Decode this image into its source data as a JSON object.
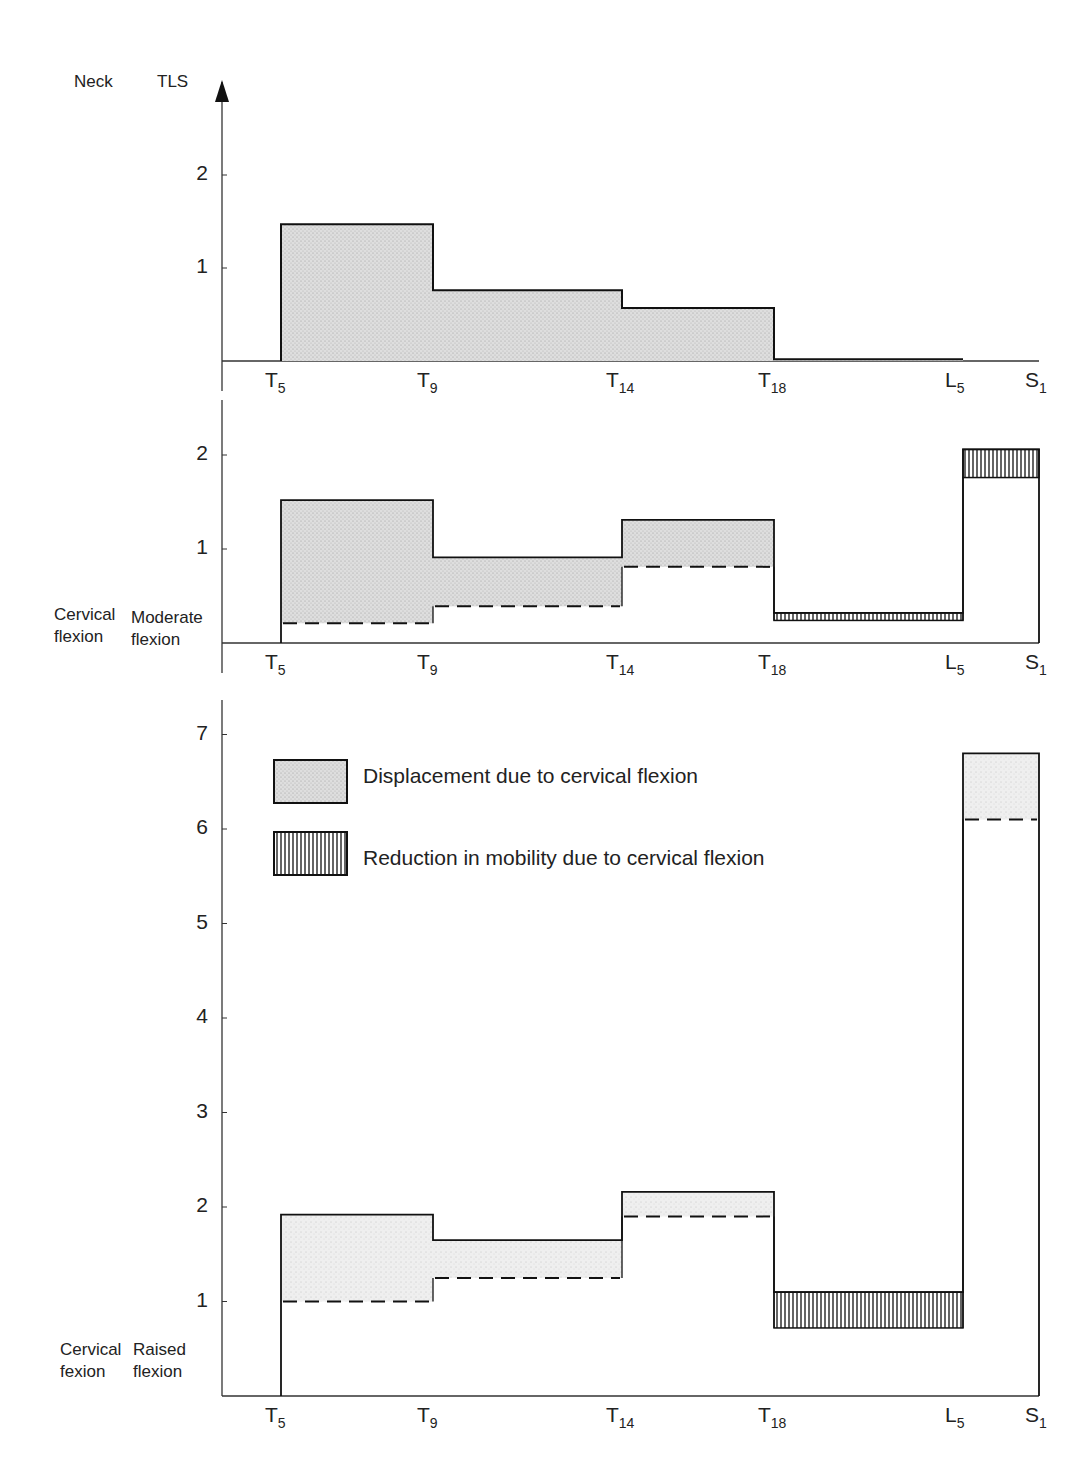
{
  "header": {
    "neck_label": "Neck",
    "tls_label": "TLS"
  },
  "panels": [
    {
      "id": "top",
      "left_label": [
        "",
        ""
      ],
      "right_label": [
        "",
        ""
      ]
    },
    {
      "id": "middle",
      "left_label": [
        "Cervical",
        "flexion"
      ],
      "right_label": [
        "Moderate",
        "flexion"
      ]
    },
    {
      "id": "bottom",
      "left_label": [
        "Cervical",
        "fexion"
      ],
      "right_label": [
        "Raised",
        "flexion"
      ]
    }
  ],
  "legend": {
    "displacement_label": "Displacement due to cervical flexion",
    "reduction_label": "Reduction in mobility due to cervical flexion"
  },
  "colors": {
    "stipple_fill": "#d9d9d9",
    "line": "#1a1a1a",
    "hatch": "#222222",
    "background": "#ffffff"
  },
  "chart_data": [
    {
      "type": "bar",
      "title": "Neck / TLS — baseline (neck neutral)",
      "categories": [
        "T5-T9",
        "T9-T14",
        "T14-T18",
        "T18-L5",
        "L5-S1"
      ],
      "x_ticks": [
        "T5",
        "T9",
        "T14",
        "T18",
        "L5",
        "S1"
      ],
      "y_ticks": [
        1,
        2
      ],
      "ylim": [
        0,
        2.6
      ],
      "series": [
        {
          "name": "Displacement due to cervical flexion",
          "values": [
            1.47,
            0.76,
            0.57,
            0.02,
            0
          ]
        }
      ]
    },
    {
      "type": "bar",
      "title": "Cervical flexion / Moderate flexion",
      "categories": [
        "T5-T9",
        "T9-T14",
        "T14-T18",
        "T18-L5",
        "L5-S1"
      ],
      "x_ticks": [
        "T5",
        "T9",
        "T14",
        "T18",
        "L5",
        "S1"
      ],
      "y_ticks": [
        1,
        2
      ],
      "ylim": [
        0,
        2.2
      ],
      "series": [
        {
          "name": "Total (solid line)",
          "values": [
            1.52,
            0.91,
            1.31,
            0.32,
            2.06
          ]
        },
        {
          "name": "Dashed baseline",
          "values": [
            0.21,
            0.39,
            0.81,
            0.24,
            1.76
          ]
        },
        {
          "name": "Displacement due to cervical flexion",
          "ranges": [
            [
              0.21,
              1.52
            ],
            [
              0.39,
              0.91
            ],
            [
              0.81,
              1.31
            ],
            null,
            null
          ]
        },
        {
          "name": "Reduction in mobility due to cervical flexion",
          "ranges": [
            null,
            null,
            null,
            [
              0.24,
              0.32
            ],
            [
              1.76,
              2.06
            ]
          ]
        }
      ]
    },
    {
      "type": "bar",
      "title": "Cervical fexion / Raised flexion",
      "categories": [
        "T5-T9",
        "T9-T14",
        "T14-T18",
        "T18-L5",
        "L5-S1"
      ],
      "x_ticks": [
        "T5",
        "T9",
        "T14",
        "T18",
        "L5",
        "S1"
      ],
      "y_ticks": [
        1,
        2,
        3,
        4,
        5,
        6,
        7
      ],
      "ylim": [
        0,
        7.2
      ],
      "series": [
        {
          "name": "Total (solid line)",
          "values": [
            1.92,
            1.65,
            2.16,
            1.1,
            6.8
          ]
        },
        {
          "name": "Dashed baseline",
          "values": [
            1.0,
            1.25,
            1.9,
            0.72,
            6.1
          ]
        },
        {
          "name": "Displacement due to cervical flexion",
          "ranges": [
            [
              1.0,
              1.92
            ],
            [
              1.25,
              1.65
            ],
            [
              1.9,
              2.16
            ],
            null,
            [
              6.1,
              6.8
            ]
          ]
        },
        {
          "name": "Reduction in mobility due to cervical flexion",
          "ranges": [
            null,
            null,
            null,
            [
              0.72,
              1.1
            ],
            null
          ]
        }
      ]
    }
  ]
}
